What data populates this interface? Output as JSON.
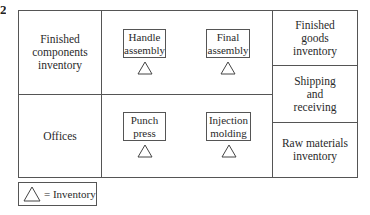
{
  "figure": {
    "number_fragment": "2"
  },
  "layout": {
    "left_column": [
      {
        "label": "Finished components inventory"
      },
      {
        "label": "Offices"
      }
    ],
    "center_top": [
      {
        "label": "Handle assembly",
        "has_inventory": true
      },
      {
        "label": "Final assembly",
        "has_inventory": true
      }
    ],
    "center_bottom": [
      {
        "label": "Punch press",
        "has_inventory": true
      },
      {
        "label": "Injection molding",
        "has_inventory": true
      }
    ],
    "right_column": [
      {
        "label": "Finished goods inventory"
      },
      {
        "label": "Shipping and receiving"
      },
      {
        "label": "Raw materials inventory"
      }
    ]
  },
  "text": {
    "fc_line1": "Finished",
    "fc_line2": "components",
    "fc_line3": "inventory",
    "offices": "Offices",
    "handle_1": "Handle",
    "handle_2": "assembly",
    "final_1": "Final",
    "final_2": "assembly",
    "punch_1": "Punch",
    "punch_2": "press",
    "inj_1": "Injection",
    "inj_2": "molding",
    "fg_1": "Finished",
    "fg_2": "goods",
    "fg_3": "inventory",
    "ship_1": "Shipping",
    "ship_2": "and",
    "ship_3": "receiving",
    "raw_1": "Raw materials",
    "raw_2": "inventory"
  },
  "legend": {
    "symbol": "triangle-inventory-icon",
    "label": "= Inventory"
  },
  "colors": {
    "line": "#555555",
    "text": "#2a2a2a",
    "background": "#ffffff"
  }
}
